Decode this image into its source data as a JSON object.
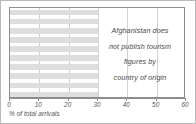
{
  "chart_data": {
    "type": "bar",
    "orientation": "horizontal",
    "title": "",
    "xlabel": "% of total arrivals",
    "ylabel": "",
    "xlim": [
      0,
      60
    ],
    "xticks": [
      0,
      10,
      20,
      30,
      40,
      50,
      60
    ],
    "xtick_labels": [
      "0",
      "10",
      "20",
      "30",
      "40",
      "50",
      "60"
    ],
    "grid": "vertical",
    "legend": "none",
    "categories": [
      "",
      "",
      "",
      "",
      "",
      "",
      "",
      "",
      "",
      ""
    ],
    "values": [
      30,
      30,
      30,
      30,
      30,
      30,
      30,
      30,
      30,
      30
    ],
    "bar_color": "#dededf",
    "annotation_lines": [
      "Afghanistan does",
      "not publish tourism",
      "figures by",
      "country of origin"
    ]
  },
  "figure": {
    "axis_color": "#8d8d8d",
    "grid_color": "#d2d2d2",
    "border_color": "#b9b9b9",
    "text_color": "#555555"
  }
}
